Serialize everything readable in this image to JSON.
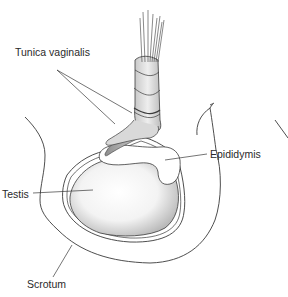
{
  "diagram": {
    "labels": [
      {
        "id": "tunica-vaginalis",
        "text": "Tunica vaginalis",
        "x": 15,
        "y": 52
      },
      {
        "id": "epididymis",
        "text": "Epididymis",
        "x": 210,
        "y": 147
      },
      {
        "id": "testis",
        "text": "Testis",
        "x": 2,
        "y": 186
      },
      {
        "id": "scrotum",
        "text": "Scrotum",
        "x": 27,
        "y": 280
      }
    ],
    "colors": {
      "line": "#3a3a3a",
      "fill_light": "#f4f4f4",
      "fill_mid": "#cfcfcf",
      "fill_dark": "#8a8a8a",
      "background": "#ffffff"
    }
  }
}
